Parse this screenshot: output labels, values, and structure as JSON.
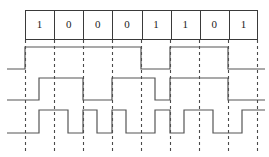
{
  "figure": {
    "width": 269,
    "height": 157,
    "background_color": "#ffffff",
    "line_color": "#555555",
    "grid_color": "#4a4a4a",
    "text_color": "#222222"
  },
  "bit_table": {
    "start_x": 25,
    "end_x": 258,
    "top_y": 10,
    "bottom_y": 40,
    "cell_count": 8,
    "bits": [
      "1",
      "0",
      "0",
      "0",
      "1",
      "1",
      "0",
      "1"
    ]
  },
  "grid": {
    "top_y": 40,
    "bottom_y": 151,
    "x_positions": [
      25,
      54,
      83,
      112,
      141,
      170,
      199,
      228,
      257
    ]
  },
  "chart_data": {
    "type": "line",
    "xlabel": "",
    "ylabel": "",
    "categories": [
      "1",
      "0",
      "0",
      "0",
      "1",
      "1",
      "0",
      "1"
    ],
    "bit_period": 29,
    "x_start": 25,
    "grid": true,
    "legend": "none",
    "series": [
      {
        "name": "waveform-1",
        "row_index": 0,
        "high_y": 47,
        "low_y": 69,
        "lead_in_low_from_x": 7,
        "levels": [
          1,
          1,
          1,
          1,
          0,
          1,
          1,
          0
        ],
        "points": "7,69 25,69 25,47 141,47 141,69 170,69 170,47 228,47 228,69 265,69"
      },
      {
        "name": "waveform-2",
        "row_index": 1,
        "high_y": 78,
        "low_y": 100,
        "lead_in_low_from_x": 7,
        "levels": [
          0,
          1,
          0,
          1,
          0,
          1,
          1,
          0
        ],
        "points": "7,100 39,100 39,78 83,78 83,100 112,100 112,78 155,78 155,100 170,100 170,78 228,78 228,100 265,100"
      },
      {
        "name": "waveform-3",
        "row_index": 2,
        "high_y": 110,
        "low_y": 133,
        "lead_in_low_from_x": 7,
        "levels": [
          0,
          1,
          0,
          1,
          0,
          1,
          0,
          1
        ],
        "points": "7,133 39,133 39,110 68,110 68,133 83,133 83,110 97,110 97,133 112,133 112,110 126,110 126,133 155,133 155,110 170,110 170,133 184,133 184,110 213,110 213,133 242,133 242,110 265,110"
      }
    ]
  }
}
